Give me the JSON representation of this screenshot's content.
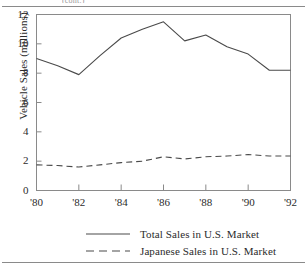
{
  "figure": {
    "header_note": "(cont.)",
    "background": "#ffffff",
    "ink": "#2b2b2b",
    "rule_color": "#8a8a8a"
  },
  "chart_data": {
    "type": "line",
    "title": "",
    "xlabel": "",
    "ylabel": "Vehicle Sales (millions)",
    "x": [
      1980,
      1981,
      1982,
      1983,
      1984,
      1985,
      1986,
      1987,
      1988,
      1989,
      1990,
      1991,
      1992
    ],
    "x_tick_values": [
      1980,
      1982,
      1984,
      1986,
      1988,
      1990,
      1992
    ],
    "x_tick_labels": [
      "'80",
      "'82",
      "'84",
      "'86",
      "'88",
      "'90",
      "'92"
    ],
    "xlim": [
      1980,
      1992
    ],
    "y_tick_values": [
      0,
      2,
      4,
      6,
      8,
      10,
      12
    ],
    "y_tick_labels": [
      "0",
      "2",
      "4",
      "6",
      "8",
      "10",
      "12"
    ],
    "ylim": [
      0,
      12
    ],
    "grid": false,
    "legend_position": "below",
    "series": [
      {
        "name": "Total Sales in U.S. Market",
        "style": "solid",
        "color": "#4a4a4a",
        "values": [
          9.0,
          8.5,
          7.9,
          9.2,
          10.4,
          11.0,
          11.5,
          10.2,
          10.6,
          9.8,
          9.3,
          8.2,
          8.2
        ]
      },
      {
        "name": "Japanese Sales in U.S. Market",
        "style": "dashed",
        "color": "#4a4a4a",
        "values": [
          1.75,
          1.7,
          1.6,
          1.75,
          1.9,
          2.0,
          2.3,
          2.15,
          2.3,
          2.35,
          2.45,
          2.35,
          2.35
        ]
      }
    ]
  },
  "legend": {
    "items": [
      {
        "label": "Total Sales in U.S. Market",
        "style": "solid"
      },
      {
        "label": "Japanese Sales in U.S. Market",
        "style": "dashed"
      }
    ]
  }
}
